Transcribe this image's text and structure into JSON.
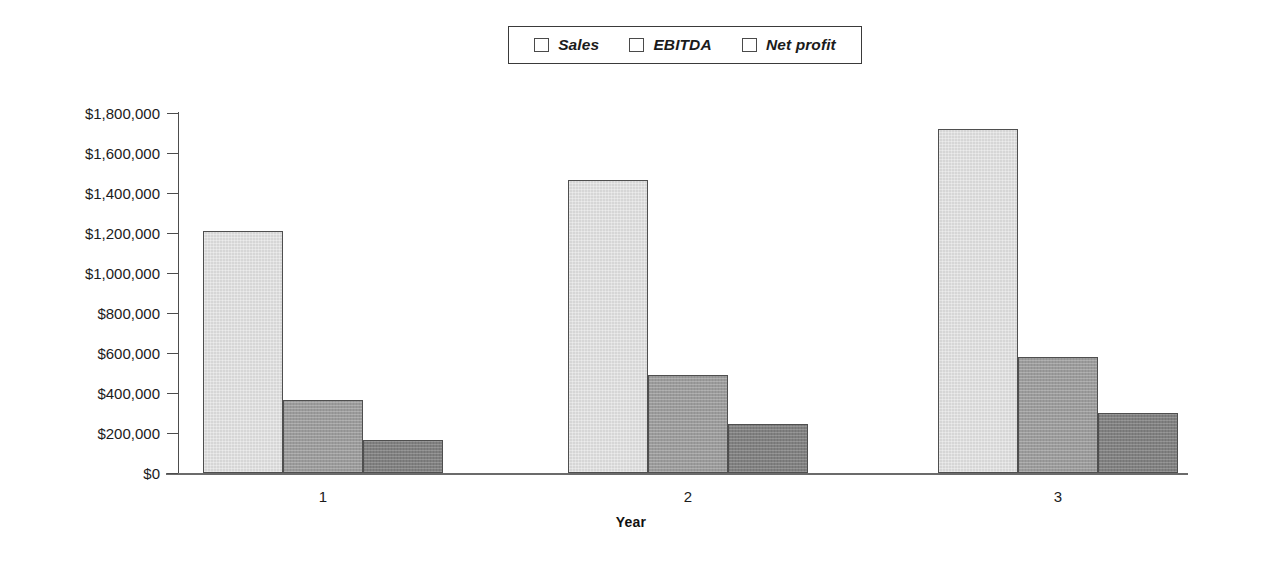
{
  "chart_data": {
    "type": "bar",
    "title": "",
    "xlabel": "Year",
    "ylabel": "",
    "categories": [
      "1",
      "2",
      "3"
    ],
    "series": [
      {
        "name": "Sales",
        "values": [
          1210000,
          1465000,
          1720000
        ],
        "color": "#d6d6d6"
      },
      {
        "name": "EBITDA",
        "values": [
          365000,
          490000,
          578000
        ],
        "color": "#9b9b9b"
      },
      {
        "name": "Net profit",
        "values": [
          165000,
          245000,
          300000
        ],
        "color": "#808080"
      }
    ],
    "ylim": [
      0,
      1800000
    ],
    "ytick_values": [
      0,
      200000,
      400000,
      600000,
      800000,
      1000000,
      1200000,
      1400000,
      1600000,
      1800000
    ],
    "ytick_labels": [
      "$0",
      "$200,000",
      "$400,000",
      "$600,000",
      "$800,000",
      "$1,000,000",
      "$1,200,000",
      "$1,400,000",
      "$1,600,000",
      "$1,800,000"
    ],
    "grid": false,
    "legend_position": "top-center",
    "legend_entries": [
      "Sales",
      "EBITDA",
      "Net profit"
    ]
  },
  "legend": {
    "items": [
      {
        "label": "Sales",
        "swatch": "#d6d6d6"
      },
      {
        "label": "EBITDA",
        "swatch": "#9b9b9b"
      },
      {
        "label": "Net profit",
        "swatch": "#808080"
      }
    ]
  },
  "axes": {
    "x_title": "Year",
    "category_labels": [
      "1",
      "2",
      "3"
    ]
  }
}
